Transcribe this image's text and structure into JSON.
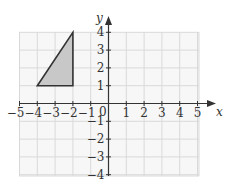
{
  "chart_data": {
    "type": "scatter",
    "title": "",
    "xlabel": "x",
    "ylabel": "y",
    "xlim": [
      -5,
      5
    ],
    "ylim": [
      -4,
      4
    ],
    "grid": true,
    "x_ticks": [
      -5,
      -4,
      -3,
      -2,
      -1,
      1,
      2,
      3,
      4,
      5
    ],
    "y_ticks": [
      4,
      3,
      2,
      1,
      -1,
      -2,
      -3,
      -4
    ],
    "origin_label": "0",
    "shapes": [
      {
        "type": "triangle",
        "fill": "#c8c8c8",
        "stroke": "#333333",
        "vertices": [
          [
            -4,
            1
          ],
          [
            -2,
            1
          ],
          [
            -2,
            4
          ]
        ]
      }
    ]
  },
  "labels": {
    "x_axis": "x",
    "y_axis": "y",
    "origin": "0",
    "x_ticks": [
      "−5",
      "−4",
      "−3",
      "−2",
      "−1",
      "1",
      "2",
      "3",
      "4",
      "5"
    ],
    "y_ticks": [
      "4",
      "3",
      "2",
      "1",
      "−1",
      "−2",
      "−3",
      "−4"
    ]
  },
  "colors": {
    "grid": "#d9d9d9",
    "grid_bg": "#f7f7f7",
    "axis": "#333333",
    "shape_fill": "#c8c8c8",
    "shape_stroke": "#333333"
  }
}
